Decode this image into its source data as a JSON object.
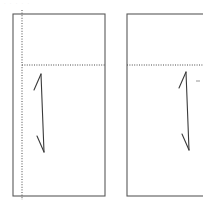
{
  "figure": {
    "title_artifact": "· · · · ·",
    "background_color": "#ffffff",
    "outline_color": "#5a5a5a",
    "dotted_color": "#4a4a4a",
    "arrow_color": "#3a3a3a",
    "width": 203,
    "height": 211
  },
  "panels": [
    {
      "id": "left-panel",
      "label": "left-panel",
      "x": 13,
      "y": 14,
      "width": 92,
      "height": 182,
      "centerline": {
        "label": "vertical-centerline",
        "orientation": "vertical",
        "x": 22,
        "y_start": 10,
        "y_end": 200,
        "style": "dotted"
      },
      "datum_line": {
        "label": "horizontal-datum-line",
        "orientation": "horizontal",
        "y": 65,
        "x_start": 22,
        "x_end": 105,
        "style": "dotted"
      },
      "dimension_arrow": {
        "label": "dimension-arrow",
        "x_top": 41,
        "y_top": 74,
        "x_bottom": 44,
        "y_bottom": 152,
        "barb_top": {
          "x": 34,
          "y": 90
        },
        "barb_bottom": {
          "x": 37,
          "y": 136
        }
      }
    },
    {
      "id": "right-panel",
      "label": "right-panel",
      "x": 127,
      "y": 14,
      "width": 86,
      "height": 182,
      "centerline": null,
      "datum_line": {
        "label": "horizontal-datum-line",
        "orientation": "horizontal",
        "y": 65,
        "x_start": 127,
        "x_end": 213,
        "style": "dotted"
      },
      "dimension_arrow": {
        "label": "dimension-arrow",
        "x_top": 186,
        "y_top": 72,
        "x_bottom": 189,
        "y_bottom": 150,
        "barb_top": {
          "x": 179,
          "y": 88
        },
        "barb_bottom": {
          "x": 182,
          "y": 134
        }
      },
      "tick_mark": {
        "label": "tick-mark",
        "x_start": 196,
        "x_end": 200,
        "y": 81
      }
    }
  ]
}
